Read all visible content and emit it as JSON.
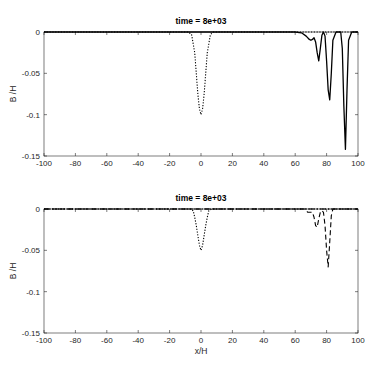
{
  "chart_data": [
    {
      "type": "line",
      "title": "time = 8e+03",
      "xlabel": "",
      "ylabel": "B /H",
      "xlim": [
        -100,
        100
      ],
      "ylim": [
        -0.15,
        0
      ],
      "xticks": [
        -100,
        -80,
        -60,
        -40,
        -20,
        0,
        20,
        40,
        60,
        80,
        100
      ],
      "yticks": [
        0,
        -0.05,
        -0.1,
        -0.15
      ],
      "ytick_labels": [
        "0",
        "-0.05",
        "-0.1",
        "-0.15"
      ],
      "grid": false,
      "series": [
        {
          "name": "initial (dotted)",
          "style": "dotted",
          "x": [
            -100,
            -8,
            -6,
            -4,
            -3,
            -2,
            -1,
            0,
            1,
            2,
            3,
            4,
            6,
            8,
            60,
            100
          ],
          "y": [
            0,
            0,
            -0.003,
            -0.025,
            -0.05,
            -0.075,
            -0.093,
            -0.1,
            -0.093,
            -0.075,
            -0.05,
            -0.025,
            -0.003,
            0,
            0,
            0
          ]
        },
        {
          "name": "solution (solid)",
          "style": "solid",
          "x": [
            -100,
            60,
            64,
            67,
            69,
            70,
            71,
            72,
            73,
            74,
            75,
            76,
            77,
            78,
            79,
            80,
            81,
            82,
            83,
            84,
            86,
            89,
            90,
            91,
            92,
            93,
            94,
            96,
            100
          ],
          "y": [
            0,
            0,
            -0.001,
            -0.005,
            -0.009,
            -0.01,
            -0.009,
            -0.007,
            -0.012,
            -0.025,
            -0.035,
            -0.02,
            -0.004,
            0,
            -0.005,
            -0.035,
            -0.07,
            -0.082,
            -0.05,
            -0.01,
            0,
            0,
            -0.02,
            -0.09,
            -0.142,
            -0.07,
            -0.01,
            0,
            0
          ]
        }
      ]
    },
    {
      "type": "line",
      "title": "time = 8e+03",
      "xlabel": "x/H",
      "ylabel": "B /H",
      "xlim": [
        -100,
        100
      ],
      "ylim": [
        -0.15,
        0
      ],
      "xticks": [
        -100,
        -80,
        -60,
        -40,
        -20,
        0,
        20,
        40,
        60,
        80,
        100
      ],
      "yticks": [
        0,
        -0.05,
        -0.1,
        -0.15
      ],
      "ytick_labels": [
        "0",
        "-0.05",
        "-0.1",
        "-0.15"
      ],
      "grid": false,
      "series": [
        {
          "name": "reference (dash-dot)",
          "style": "dashdot",
          "x": [
            -100,
            100
          ],
          "y": [
            0,
            0
          ]
        },
        {
          "name": "initial (dotted)",
          "style": "dotted",
          "x": [
            -100,
            -7,
            -5,
            -4,
            -3,
            -2,
            -1,
            0,
            1,
            2,
            3,
            4,
            5,
            7,
            60,
            100
          ],
          "y": [
            0,
            0,
            -0.002,
            -0.01,
            -0.02,
            -0.032,
            -0.044,
            -0.05,
            -0.044,
            -0.032,
            -0.02,
            -0.01,
            -0.002,
            0,
            0,
            0
          ]
        },
        {
          "name": "solution (dashed)",
          "style": "dashed",
          "x": [
            -100,
            66,
            68,
            70,
            71,
            72,
            73,
            74,
            75,
            76,
            77,
            78,
            79,
            80,
            81,
            82,
            83,
            84,
            100
          ],
          "y": [
            0,
            0,
            -0.004,
            -0.004,
            -0.004,
            -0.01,
            -0.02,
            -0.022,
            -0.012,
            -0.004,
            -0.002,
            -0.004,
            -0.02,
            -0.05,
            -0.07,
            -0.04,
            -0.008,
            0,
            0
          ]
        }
      ]
    }
  ],
  "colors": {
    "line": "#000000",
    "axis": "#262626"
  }
}
